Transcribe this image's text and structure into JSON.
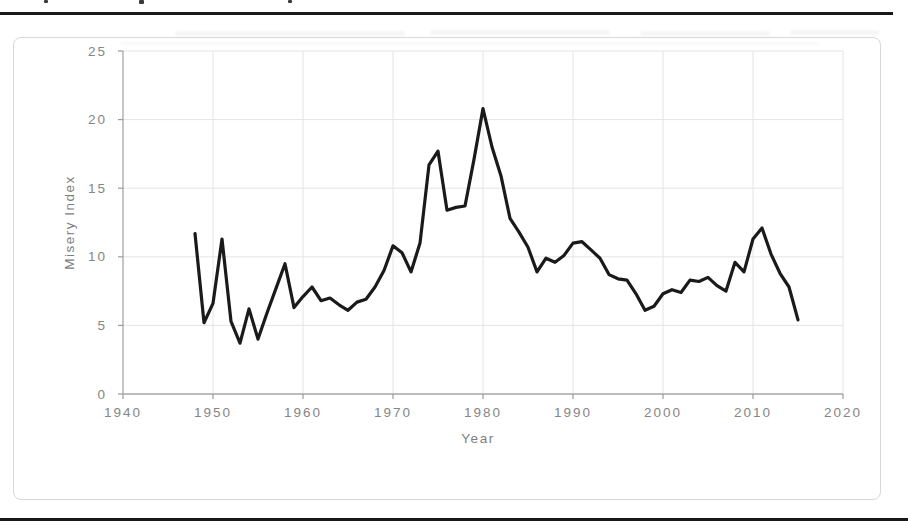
{
  "colors": {
    "line": "#1a1a1a",
    "grid": "#e4e4e4",
    "axis": "#a6a6a6",
    "tick": "#9b9b9b",
    "tick_label": "#858585",
    "axis_title": "#7d7d7d",
    "frame_border": "#d8d8d8",
    "rule": "#181818"
  },
  "chart_data": {
    "type": "line",
    "title": "",
    "xlabel": "Year",
    "ylabel": "Misery Index",
    "xlim": [
      1940,
      2020
    ],
    "ylim": [
      0,
      25
    ],
    "x_ticks": [
      1940,
      1950,
      1960,
      1970,
      1980,
      1990,
      2000,
      2010,
      2020
    ],
    "y_ticks": [
      0,
      5,
      10,
      15,
      20,
      25
    ],
    "grid": true,
    "legend": false,
    "x": [
      1948,
      1949,
      1950,
      1951,
      1952,
      1953,
      1954,
      1955,
      1956,
      1957,
      1958,
      1959,
      1960,
      1961,
      1962,
      1963,
      1964,
      1965,
      1966,
      1967,
      1968,
      1969,
      1970,
      1971,
      1972,
      1973,
      1974,
      1975,
      1976,
      1977,
      1978,
      1979,
      1980,
      1981,
      1982,
      1983,
      1984,
      1985,
      1986,
      1987,
      1988,
      1989,
      1990,
      1991,
      1992,
      1993,
      1994,
      1995,
      1996,
      1997,
      1998,
      1999,
      2000,
      2001,
      2002,
      2003,
      2004,
      2005,
      2006,
      2007,
      2008,
      2009,
      2010,
      2011,
      2012,
      2013,
      2014,
      2015
    ],
    "values": [
      11.7,
      5.2,
      6.6,
      11.3,
      5.3,
      3.7,
      6.2,
      4.0,
      5.9,
      7.7,
      9.5,
      6.3,
      7.1,
      7.8,
      6.8,
      7.0,
      6.5,
      6.1,
      6.7,
      6.9,
      7.8,
      9.0,
      10.8,
      10.3,
      8.9,
      11.0,
      16.7,
      17.7,
      13.4,
      13.6,
      13.7,
      17.1,
      20.8,
      18.0,
      15.9,
      12.8,
      11.8,
      10.7,
      8.9,
      9.9,
      9.6,
      10.1,
      11.0,
      11.1,
      10.5,
      9.9,
      8.7,
      8.4,
      8.3,
      7.3,
      6.1,
      6.4,
      7.3,
      7.6,
      7.4,
      8.3,
      8.2,
      8.5,
      7.9,
      7.5,
      9.6,
      8.9,
      11.3,
      12.1,
      10.2,
      8.8,
      7.8,
      5.4
    ]
  }
}
